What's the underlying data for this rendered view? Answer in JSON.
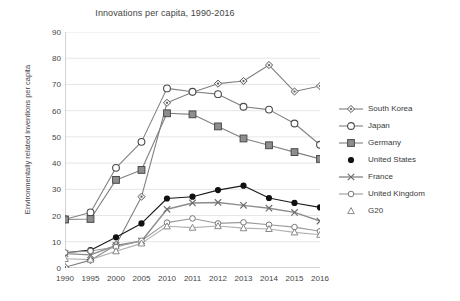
{
  "chart_data": {
    "type": "line",
    "title": "Innovations per capita, 1990-2016",
    "xlabel": "",
    "ylabel": "Environmentally related inventions per capita",
    "categories": [
      "1990",
      "1995",
      "2000",
      "2005",
      "2010",
      "2011",
      "2012",
      "2013",
      "2014",
      "2015",
      "2016"
    ],
    "ylim": [
      0,
      90
    ],
    "yticks": [
      0,
      10,
      20,
      30,
      40,
      50,
      60,
      70,
      80,
      90
    ],
    "grid": true,
    "legend_position": "right",
    "series": [
      {
        "name": "South Korea",
        "marker": "diamond",
        "color": "#808080",
        "values": [
          0.3,
          3.0,
          8.8,
          27.2,
          63.0,
          67.0,
          70.3,
          71.3,
          77.4,
          67.3,
          69.4
        ]
      },
      {
        "name": "Japan",
        "marker": "circle-open",
        "color": "#808080",
        "values": [
          18.6,
          21.2,
          38.2,
          48.1,
          68.5,
          67.2,
          66.3,
          61.5,
          60.4,
          55.1,
          47.0
        ]
      },
      {
        "name": "Germany",
        "marker": "square",
        "color": "#808080",
        "values": [
          18.5,
          18.7,
          33.6,
          37.4,
          59.0,
          58.6,
          54.0,
          49.4,
          46.8,
          44.2,
          41.6
        ]
      },
      {
        "name": "United States",
        "marker": "circle-filled",
        "color": "#1a1a1a",
        "values": [
          5.8,
          6.8,
          11.7,
          17.0,
          26.5,
          27.2,
          29.7,
          31.4,
          26.7,
          24.8,
          23.1
        ]
      },
      {
        "name": "France",
        "marker": "cross",
        "color": "#8c8c8c",
        "values": [
          5.5,
          5.0,
          8.6,
          10.3,
          22.4,
          24.8,
          25.0,
          23.9,
          22.8,
          21.2,
          17.9
        ]
      },
      {
        "name": "United Kingdom",
        "marker": "circle-small",
        "color": "#9a9a9a",
        "values": [
          5.9,
          6.5,
          8.0,
          10.4,
          17.3,
          18.9,
          17.0,
          17.4,
          16.5,
          15.6,
          14.0
        ]
      },
      {
        "name": "G20",
        "marker": "triangle",
        "color": "#b0b0b0",
        "values": [
          3.5,
          3.2,
          6.4,
          9.4,
          15.9,
          15.4,
          16.0,
          15.2,
          14.9,
          13.6,
          12.7
        ]
      }
    ]
  },
  "legend": {
    "items": [
      {
        "label": "South Korea",
        "icon": "diamond-marker-icon"
      },
      {
        "label": "Japan",
        "icon": "circle-open-marker-icon"
      },
      {
        "label": "Germany",
        "icon": "square-marker-icon"
      },
      {
        "label": "United States",
        "icon": "circle-filled-marker-icon"
      },
      {
        "label": "France",
        "icon": "cross-marker-icon"
      },
      {
        "label": "United Kingdom",
        "icon": "circle-small-marker-icon"
      },
      {
        "label": "G20",
        "icon": "triangle-marker-icon"
      }
    ]
  },
  "colors": {
    "grid": "#e6e6e6",
    "axis": "#a8a8a8",
    "text": "#3a3a3a",
    "background": "#ffffff"
  }
}
